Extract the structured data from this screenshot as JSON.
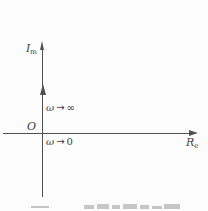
{
  "figure": {
    "type": "complex-plane axis sketch (polar / Nyquist frequency-response figure)",
    "y_axis_label": {
      "base": "I",
      "sub": "m"
    },
    "x_axis_label": {
      "base": "R",
      "sub": "e"
    },
    "origin_label": "O",
    "annotations": {
      "omega_to_inf": {
        "omega": "ω",
        "arrow": "→",
        "limit": "∞"
      },
      "omega_to_zero": {
        "omega": "ω",
        "arrow": "→",
        "limit": "0"
      }
    },
    "colors": {
      "background": "#fcfcfc",
      "axis_color": "#515151",
      "text_color": "#3f3f3f",
      "caption_color": "#c6c6c6"
    }
  }
}
